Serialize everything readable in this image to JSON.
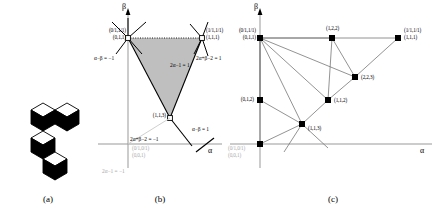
{
  "figure": {
    "panels": [
      {
        "id": "a",
        "caption": "(a)"
      },
      {
        "id": "b",
        "caption": "(b)"
      },
      {
        "id": "c",
        "caption": "(c)"
      }
    ]
  },
  "panel_a": {
    "name": "lozenge-tiling-diagram",
    "description": "black and white lozenge tiling"
  },
  "panel_b": {
    "axis_x": "α",
    "axis_y": "β",
    "vertices": [
      {
        "name": "top-left",
        "frac": "(0/1,1/1)",
        "triple": "(0,1,1)"
      },
      {
        "name": "top-right",
        "frac": "(1/1,1/1)",
        "triple": "(1,1,1)"
      },
      {
        "name": "bottom",
        "frac": "",
        "triple": "(1,1,3)"
      },
      {
        "name": "origin",
        "frac": "(0/1,0/1)",
        "triple": "(0,0,1)"
      }
    ],
    "equations": [
      {
        "name": "alpha-minus-beta-neg-one",
        "text": "α−β = −1"
      },
      {
        "name": "two-alpha-minus-one-eq-one",
        "text": "2α−1 = 1"
      },
      {
        "name": "two-alpha-plus-beta-minus-two-eq-neg-one",
        "text": "2α+β−2 = −1"
      },
      {
        "name": "two-alpha-plus-beta-minus-two-eq-one",
        "text": "2α+β−2 = 1"
      },
      {
        "name": "alpha-minus-beta-eq-one",
        "text": "α−β = 1"
      },
      {
        "name": "two-alpha-minus-one-eq-neg-one",
        "text": "2α−1 = −1"
      }
    ]
  },
  "panel_c": {
    "axis_x": "α",
    "axis_y": "β",
    "nodes": [
      {
        "id": "n011",
        "frac": "(0/1,1/1)",
        "triple": "(0,1,1)"
      },
      {
        "id": "n122",
        "frac": "",
        "triple": "(1,2,2)"
      },
      {
        "id": "n111",
        "frac": "(1/1,1/1)",
        "triple": "(1,1,1)"
      },
      {
        "id": "n223",
        "frac": "",
        "triple": "(2,2,3)"
      },
      {
        "id": "n112",
        "frac": "",
        "triple": "(1,1,2)"
      },
      {
        "id": "n012",
        "frac": "",
        "triple": "(0,1,2)"
      },
      {
        "id": "n113",
        "frac": "",
        "triple": "(1,1,3)"
      },
      {
        "id": "n001",
        "frac": "(0/1,0/1)",
        "triple": "(0,0,1)"
      }
    ]
  },
  "colors": {
    "shade": "#bfbfbf",
    "axis": "#999999",
    "stroke": "#000000",
    "grey_text": "#a8a8a8"
  }
}
